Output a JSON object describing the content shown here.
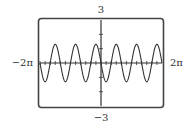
{
  "chart_data": {
    "type": "line",
    "title": "",
    "xlabel": "",
    "ylabel": "",
    "xlim": [
      -6.283185,
      6.283185
    ],
    "ylim": [
      -3,
      3
    ],
    "xlim_labels": {
      "min": "−2π",
      "max": "2π"
    },
    "ylim_labels": {
      "min": "−3",
      "max": "3"
    },
    "x_ticks_step": 0.5235988,
    "y_ticks": [
      -2,
      -1,
      1,
      2
    ],
    "grid": false,
    "legend": "none",
    "series": [
      {
        "name": "f(x)",
        "function": "-1.3*sin(3x)",
        "amplitude": 1.3,
        "frequency": 3,
        "phase": 3.14159265,
        "samples": 600
      }
    ]
  },
  "colors": {
    "frame": "#444444",
    "axis": "#333333",
    "curve": "#333333",
    "background": "#ffffff"
  }
}
